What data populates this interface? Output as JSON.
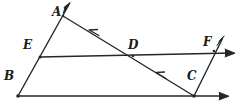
{
  "figure": {
    "type": "geometry-diagram",
    "width": 242,
    "height": 106,
    "stroke_color": "#262626",
    "background_color": "#ffffff",
    "points": [
      {
        "id": "A",
        "label": "A",
        "x": 63,
        "y": 16,
        "label_x": 52,
        "label_y": 6
      },
      {
        "id": "B",
        "label": "B",
        "x": 18,
        "y": 96,
        "label_x": 4,
        "label_y": 70
      },
      {
        "id": "C",
        "label": "C",
        "x": 194,
        "y": 96,
        "label_x": 187,
        "label_y": 70
      },
      {
        "id": "D",
        "label": "D",
        "x": 133,
        "y": 56,
        "label_x": 128,
        "label_y": 39
      },
      {
        "id": "E",
        "label": "E",
        "x": 40,
        "y": 57,
        "label_x": 23,
        "label_y": 39
      },
      {
        "id": "F",
        "label": "F",
        "x": 214,
        "y": 51,
        "label_x": 203,
        "label_y": 36
      }
    ],
    "segments": [
      {
        "id": "ray-BA",
        "from": "B",
        "to": "A",
        "arrow_end": true,
        "tip_x": 70,
        "tip_y": 3
      },
      {
        "id": "ray-AC",
        "from": "A",
        "to": "C",
        "arrow_end": false,
        "ticks": 2
      },
      {
        "id": "line-E-right",
        "from": "E",
        "to": "right-arrow",
        "arrow_end": true,
        "tip_x": 234,
        "tip_y": 53
      },
      {
        "id": "line-B-right",
        "from": "B",
        "to": "right-arrow",
        "arrow_end": true,
        "tip_x": 228,
        "tip_y": 96
      },
      {
        "id": "ray-CF",
        "from": "C",
        "to": "F",
        "arrow_end": true,
        "tip_x": 224,
        "tip_y": 36
      }
    ],
    "tick_marks": [
      {
        "id": "tick-AD",
        "x": 93,
        "y": 31,
        "on": "ray-AC"
      },
      {
        "id": "tick-DC",
        "x": 160,
        "y": 74,
        "on": "ray-AC"
      }
    ]
  }
}
